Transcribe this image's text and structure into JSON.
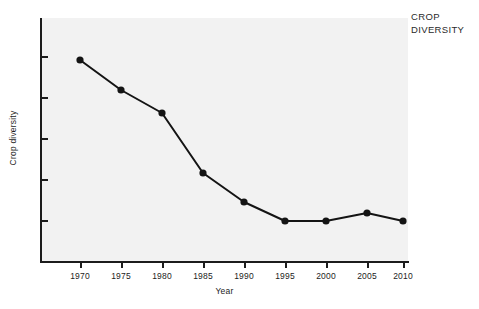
{
  "annotation": {
    "line1": "CROP",
    "line2": "DIVERSITY"
  },
  "chart_data": {
    "type": "line",
    "title": "",
    "annotation": "CROP DIVERSITY",
    "xlabel": "Year",
    "ylabel": "Crop diversity",
    "categories": [
      1970,
      1975,
      1980,
      1985,
      1990,
      1995,
      2000,
      2005,
      2010
    ],
    "xtick_labels": [
      "1970",
      "1975",
      "1980",
      "1985",
      "1990",
      "1995",
      "2000",
      "2005",
      "2010"
    ],
    "ytick_labels": [
      "",
      "",
      "",
      "",
      "",
      ""
    ],
    "ytick_count": 6,
    "values": [
      83,
      68,
      56,
      26,
      12,
      3,
      3,
      7,
      3
    ],
    "ylim": [
      0,
      100
    ],
    "xlim": [
      1967.5,
      2012.5
    ],
    "grid": false,
    "legend": false,
    "series": [
      {
        "name": "Crop diversity",
        "values": [
          83,
          68,
          56,
          26,
          12,
          3,
          3,
          7,
          3
        ],
        "color": "#141414",
        "marker": "filled-circle",
        "marker_size": 5,
        "line_width": 2
      }
    ],
    "colors": {
      "line": "#141414",
      "marker": "#141414",
      "axis": "#1c1c1c",
      "plot_background": "#f2f2f2",
      "page_background": "#ffffff",
      "text": "#1c1c1c"
    },
    "pixel_geometry": {
      "plot_left": 40,
      "plot_top": 18,
      "plot_right": 408,
      "plot_bottom": 262,
      "point_x": [
        80,
        121,
        162,
        203,
        244,
        285,
        326,
        367,
        403
      ],
      "point_y": [
        60,
        90,
        113,
        173,
        202,
        221,
        221,
        213,
        221
      ],
      "ytick_y": [
        57,
        98,
        139,
        180,
        221,
        262
      ]
    }
  }
}
